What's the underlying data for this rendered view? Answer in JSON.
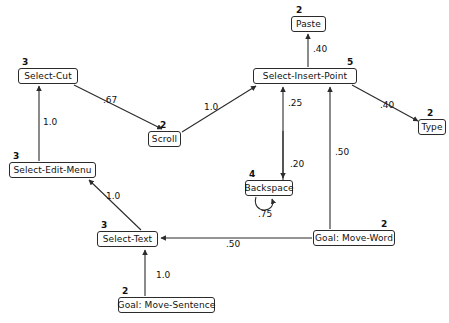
{
  "diagram": {
    "stroke_color": "#2b2b2b",
    "text_color": "#111111",
    "background": "#ffffff",
    "nodes": [
      {
        "id": "select-cut",
        "label": "Select-Cut",
        "count": "3",
        "x": 18,
        "y": 68,
        "w": 60,
        "h": 16,
        "count_x": 22,
        "count_y": 58
      },
      {
        "id": "scroll",
        "label": "Scroll",
        "count": "2",
        "x": 148,
        "y": 131,
        "w": 33,
        "h": 16,
        "count_x": 160,
        "count_y": 121
      },
      {
        "id": "select-insert-point",
        "label": "Select-Insert-Point",
        "count": "5",
        "x": 253,
        "y": 68,
        "w": 104,
        "h": 16,
        "count_x": 347,
        "count_y": 58
      },
      {
        "id": "paste",
        "label": "Paste",
        "count": "2",
        "x": 291,
        "y": 16,
        "w": 35,
        "h": 16,
        "count_x": 296,
        "count_y": 6
      },
      {
        "id": "type",
        "label": "Type",
        "count": "2",
        "x": 418,
        "y": 119,
        "w": 28,
        "h": 16,
        "count_x": 427,
        "count_y": 109
      },
      {
        "id": "select-edit-menu",
        "label": "Select-Edit-Menu",
        "count": "3",
        "x": 9,
        "y": 162,
        "w": 87,
        "h": 16,
        "count_x": 13,
        "count_y": 152
      },
      {
        "id": "backspace",
        "label": "Backspace",
        "count": "4",
        "x": 245,
        "y": 180,
        "w": 48,
        "h": 16,
        "count_x": 249,
        "count_y": 170
      },
      {
        "id": "select-text",
        "label": "Select-Text",
        "count": "3",
        "x": 97,
        "y": 231,
        "w": 61,
        "h": 16,
        "count_x": 101,
        "count_y": 221
      },
      {
        "id": "goal-move-word",
        "label": "Goal:  Move-Word",
        "count": "2",
        "x": 313,
        "y": 230,
        "w": 82,
        "h": 16,
        "count_x": 381,
        "count_y": 220
      },
      {
        "id": "goal-move-sentence",
        "label": "Goal: Move-Sentence",
        "count": "2",
        "x": 118,
        "y": 297,
        "w": 97,
        "h": 16,
        "count_x": 122,
        "count_y": 287
      }
    ],
    "edges": [
      {
        "id": "select-cut-to-scroll",
        "from": "select-cut",
        "to": "select-insert-point",
        "weight": ".67",
        "label_x": 103,
        "label_y": 96
      },
      {
        "id": "scroll-to-select-insert-point",
        "from": "scroll",
        "to": "select-insert-point",
        "weight": "1.0",
        "label_x": 204,
        "label_y": 103
      },
      {
        "id": "select-edit-menu-to-select-cut",
        "from": "select-edit-menu",
        "to": "select-cut",
        "weight": "1.0",
        "label_x": 43,
        "label_y": 118
      },
      {
        "id": "select-insert-point-to-paste",
        "from": "select-insert-point",
        "to": "paste",
        "weight": ".40",
        "label_x": 313,
        "label_y": 45
      },
      {
        "id": "select-insert-point-to-type",
        "from": "select-insert-point",
        "to": "type",
        "weight": ".40",
        "label_x": 380,
        "label_y": 101
      },
      {
        "id": "backspace-to-select-insert-point",
        "from": "backspace",
        "to": "select-insert-point",
        "weight": ".25",
        "label_x": 288,
        "label_y": 99
      },
      {
        "id": "select-insert-point-to-backspace",
        "from": "select-insert-point",
        "to": "backspace",
        "weight": ".20",
        "label_x": 290,
        "label_y": 160
      },
      {
        "id": "goal-move-word-to-select-insert-point",
        "from": "goal-move-word",
        "to": "select-insert-point",
        "weight": ".50",
        "label_x": 335,
        "label_y": 148
      },
      {
        "id": "backspace-self-loop",
        "from": "backspace",
        "to": "backspace",
        "weight": ".75",
        "label_x": 258,
        "label_y": 210
      },
      {
        "id": "select-text-to-select-edit-menu",
        "from": "select-text",
        "to": "select-edit-menu",
        "weight": "1.0",
        "label_x": 106,
        "label_y": 192
      },
      {
        "id": "goal-move-word-to-select-text",
        "from": "goal-move-word",
        "to": "select-text",
        "weight": ".50",
        "label_x": 226,
        "label_y": 240
      },
      {
        "id": "goal-move-sentence-to-select-text",
        "from": "goal-move-sentence",
        "to": "select-text",
        "weight": "1.0",
        "label_x": 156,
        "label_y": 271
      }
    ]
  }
}
